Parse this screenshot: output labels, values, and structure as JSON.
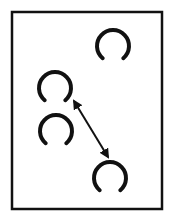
{
  "diagram": {
    "colors": {
      "stroke": "#111111",
      "background": "#ffffff"
    },
    "shapes": [
      {
        "id": "ring-top-right",
        "kind": "open-ring"
      },
      {
        "id": "ring-middle-left-upper",
        "kind": "open-ring"
      },
      {
        "id": "ring-middle-left-lower",
        "kind": "open-ring"
      },
      {
        "id": "ring-bottom-right",
        "kind": "open-ring"
      }
    ],
    "connectors": [
      {
        "id": "distance-arrow",
        "kind": "double-headed-arrow",
        "from": "ring-middle-left-upper",
        "to": "ring-bottom-right"
      }
    ]
  }
}
